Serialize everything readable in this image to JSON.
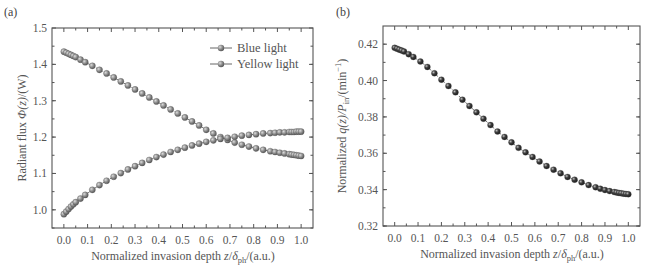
{
  "chart_data": [
    {
      "panel": "(a)",
      "type": "line",
      "title": "",
      "xlabel": "Normalized invasion depth z/δph/(a.u.)",
      "ylabel": "Radiant flux Φ(z)/(W)",
      "xlim": [
        -0.05,
        1.05
      ],
      "ylim": [
        0.95,
        1.5
      ],
      "xticks": [
        "0.0",
        "0.1",
        "0.2",
        "0.3",
        "0.4",
        "0.5",
        "0.6",
        "0.7",
        "0.8",
        "0.9",
        "1.0"
      ],
      "yticks": [
        "1.0",
        "1.1",
        "1.2",
        "1.3",
        "1.4",
        "1.5"
      ],
      "grid": false,
      "legend_position": "upper right",
      "x": [
        0.0,
        0.01,
        0.02,
        0.03,
        0.04,
        0.05,
        0.07,
        0.09,
        0.12,
        0.15,
        0.18,
        0.21,
        0.24,
        0.27,
        0.3,
        0.33,
        0.36,
        0.39,
        0.42,
        0.45,
        0.48,
        0.51,
        0.54,
        0.57,
        0.6,
        0.63,
        0.66,
        0.69,
        0.72,
        0.75,
        0.78,
        0.81,
        0.84,
        0.87,
        0.89,
        0.91,
        0.93,
        0.95,
        0.96,
        0.97,
        0.98,
        0.99,
        1.0
      ],
      "series": [
        {
          "name": "Blue light",
          "values": [
            1.435,
            1.432,
            1.429,
            1.426,
            1.423,
            1.42,
            1.413,
            1.406,
            1.396,
            1.385,
            1.375,
            1.364,
            1.353,
            1.342,
            1.331,
            1.32,
            1.309,
            1.298,
            1.287,
            1.276,
            1.265,
            1.254,
            1.243,
            1.232,
            1.22,
            1.21,
            1.2,
            1.192,
            1.185,
            1.179,
            1.174,
            1.169,
            1.165,
            1.161,
            1.159,
            1.157,
            1.155,
            1.153,
            1.152,
            1.151,
            1.15,
            1.149,
            1.148
          ]
        },
        {
          "name": "Yellow light",
          "values": [
            0.988,
            0.995,
            1.002,
            1.009,
            1.015,
            1.021,
            1.031,
            1.041,
            1.055,
            1.068,
            1.08,
            1.091,
            1.101,
            1.111,
            1.12,
            1.129,
            1.137,
            1.145,
            1.152,
            1.159,
            1.165,
            1.171,
            1.177,
            1.182,
            1.187,
            1.191,
            1.195,
            1.198,
            1.201,
            1.204,
            1.206,
            1.208,
            1.21,
            1.211,
            1.212,
            1.213,
            1.213,
            1.214,
            1.214,
            1.214,
            1.215,
            1.215,
            1.215
          ]
        }
      ]
    },
    {
      "panel": "(b)",
      "type": "line",
      "title": "",
      "xlabel": "Normalized invasion depth z/δph/(a.u.)",
      "ylabel": "Normalized q(z)/Pin/(min⁻¹)",
      "xlim": [
        -0.05,
        1.05
      ],
      "ylim": [
        0.32,
        0.43
      ],
      "xticks": [
        "0.0",
        "0.1",
        "0.2",
        "0.3",
        "0.4",
        "0.5",
        "0.6",
        "0.7",
        "0.8",
        "0.9",
        "1.0"
      ],
      "yticks": [
        "0.32",
        "0.34",
        "0.36",
        "0.38",
        "0.40",
        "0.42"
      ],
      "grid": false,
      "x": [
        0.0,
        0.01,
        0.02,
        0.03,
        0.04,
        0.06,
        0.08,
        0.11,
        0.14,
        0.17,
        0.2,
        0.23,
        0.26,
        0.29,
        0.32,
        0.35,
        0.38,
        0.41,
        0.44,
        0.47,
        0.5,
        0.53,
        0.56,
        0.59,
        0.62,
        0.65,
        0.68,
        0.71,
        0.74,
        0.77,
        0.8,
        0.83,
        0.86,
        0.88,
        0.9,
        0.92,
        0.94,
        0.95,
        0.96,
        0.97,
        0.98,
        0.99,
        1.0
      ],
      "series": [
        {
          "name": "Normalized q(z)/Pin",
          "values": [
            0.418,
            0.4175,
            0.417,
            0.4165,
            0.416,
            0.4145,
            0.413,
            0.4105,
            0.4075,
            0.404,
            0.4005,
            0.397,
            0.3935,
            0.3895,
            0.386,
            0.3825,
            0.379,
            0.3755,
            0.372,
            0.369,
            0.366,
            0.363,
            0.3605,
            0.358,
            0.3555,
            0.353,
            0.351,
            0.349,
            0.347,
            0.3455,
            0.344,
            0.3425,
            0.3413,
            0.3405,
            0.3398,
            0.3392,
            0.3387,
            0.3384,
            0.3382,
            0.338,
            0.3378,
            0.3376,
            0.3375
          ]
        }
      ]
    }
  ],
  "panels": {
    "a": {
      "label": "(a)",
      "ylabel_main": "Radiant flux ",
      "ylabel_sym": "Φ(z)",
      "ylabel_unit": "/(W)",
      "xlabel_main": "Normalized invasion depth ",
      "xlabel_z": "z",
      "xlabel_slash": "/",
      "xlabel_delta": "δ",
      "xlabel_sub": "ph",
      "xlabel_unit": "/(a.u.)",
      "legend": [
        "Blue light",
        "Yellow light"
      ]
    },
    "b": {
      "label": "(b)",
      "ylabel_main": "Normalized ",
      "ylabel_sym": "q(z)/P",
      "ylabel_sub": "in",
      "ylabel_unit": "/(min",
      "ylabel_sup": "−1",
      "ylabel_close": ")",
      "xlabel_main": "Normalized invasion depth ",
      "xlabel_z": "z",
      "xlabel_slash": "/",
      "xlabel_delta": "δ",
      "xlabel_sub": "ph",
      "xlabel_unit": "/(a.u.)"
    }
  },
  "colors": {
    "axis": "#555555",
    "marker_fill": "#8a8a8a",
    "marker_fill_b": "#3a3a3a",
    "marker_highlight": "#d8d8d8",
    "line": "#666666",
    "text": "#555555"
  }
}
